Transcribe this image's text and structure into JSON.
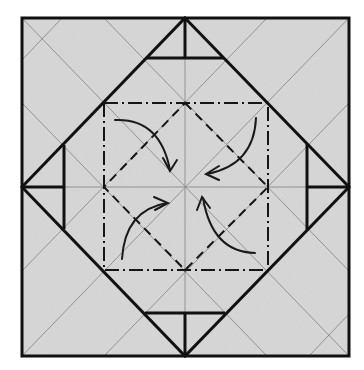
{
  "diagram": {
    "type": "origami-fold-diagram",
    "colors": {
      "background": "#ffffff",
      "paper": "#d6d6d6",
      "outline": "#111111",
      "crease": "#8a8a8a",
      "fold_line": "#151515",
      "arrow": "#1a1a1a"
    },
    "outer_square": {
      "x": 22,
      "y": 18,
      "w": 327,
      "h": 338
    },
    "center": {
      "x": 185,
      "y": 187
    },
    "inner_square": {
      "x": 104,
      "y": 103,
      "w": 164,
      "h": 167,
      "line_style": "mountain-fold (dash-dot)"
    },
    "inner_diamond": {
      "line_style": "valley-fold (dashed)"
    },
    "flaps": [
      {
        "position": "top",
        "label": "top-flap"
      },
      {
        "position": "right",
        "label": "right-flap"
      },
      {
        "position": "bottom",
        "label": "bottom-flap"
      },
      {
        "position": "left",
        "label": "left-flap"
      }
    ],
    "arrows": [
      {
        "quadrant": "top-left",
        "direction": "curving down-right toward center"
      },
      {
        "quadrant": "top-right",
        "direction": "curving down-left toward center"
      },
      {
        "quadrant": "bottom-left",
        "direction": "curving up-right toward center"
      },
      {
        "quadrant": "bottom-right",
        "direction": "curving up-left toward center"
      }
    ]
  }
}
